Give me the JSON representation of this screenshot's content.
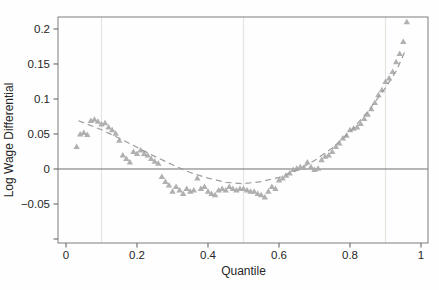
{
  "chart_data": {
    "type": "scatter",
    "title": "",
    "xlabel": "Quantile",
    "ylabel": "Log Wage Differential",
    "xlim": [
      -0.0225,
      1.0197
    ],
    "ylim": [
      -0.1057,
      0.2171
    ],
    "x_ticks": [
      0,
      0.2,
      0.4,
      0.6,
      0.8,
      1
    ],
    "x_tick_labels": [
      "0",
      "0.2",
      "0.4",
      "0.6",
      "0.8",
      "1"
    ],
    "y_ticks": [
      -0.1,
      -0.05,
      0,
      0.05,
      0.1,
      0.15,
      0.2
    ],
    "y_tick_labels": [
      "",
      "−0.05",
      "0",
      "0.05",
      "0.1",
      "0.15",
      "0.2"
    ],
    "gridlines_x": [
      0.1,
      0.5,
      0.9
    ],
    "grid": "vertical-only",
    "zero_line_y": 0,
    "legend": "none",
    "marker": "filled-triangle-up",
    "colors": {
      "marker": "#a9a9a9",
      "fit_line": "#9c9c9c",
      "grid": "#e4e4e0",
      "frame": "#7d7d7d",
      "zero_line": "#6f6f6f",
      "tick": "#5a5a5a",
      "text": "#262626",
      "background": "#fefefe"
    },
    "series_name": "log wage differential by quantile",
    "points": [
      [
        0.03,
        0.032
      ],
      [
        0.04,
        0.05
      ],
      [
        0.05,
        0.052
      ],
      [
        0.06,
        0.049
      ],
      [
        0.07,
        0.069
      ],
      [
        0.08,
        0.071
      ],
      [
        0.09,
        0.068
      ],
      [
        0.1,
        0.064
      ],
      [
        0.11,
        0.066
      ],
      [
        0.12,
        0.06
      ],
      [
        0.13,
        0.056
      ],
      [
        0.14,
        0.051
      ],
      [
        0.15,
        0.041
      ],
      [
        0.16,
        0.02
      ],
      [
        0.17,
        0.015
      ],
      [
        0.18,
        0.01
      ],
      [
        0.19,
        0.025
      ],
      [
        0.2,
        0.022
      ],
      [
        0.21,
        0.027
      ],
      [
        0.22,
        0.022
      ],
      [
        0.23,
        0.02
      ],
      [
        0.24,
        0.015
      ],
      [
        0.25,
        0.011
      ],
      [
        0.26,
        0.008
      ],
      [
        0.27,
        -0.011
      ],
      [
        0.28,
        -0.018
      ],
      [
        0.29,
        -0.023
      ],
      [
        0.3,
        -0.032
      ],
      [
        0.31,
        -0.025
      ],
      [
        0.32,
        -0.03
      ],
      [
        0.33,
        -0.035
      ],
      [
        0.34,
        -0.028
      ],
      [
        0.35,
        -0.032
      ],
      [
        0.36,
        -0.03
      ],
      [
        0.37,
        -0.013
      ],
      [
        0.38,
        -0.028
      ],
      [
        0.39,
        -0.025
      ],
      [
        0.4,
        -0.032
      ],
      [
        0.41,
        -0.035
      ],
      [
        0.42,
        -0.037
      ],
      [
        0.43,
        -0.03
      ],
      [
        0.44,
        -0.028
      ],
      [
        0.45,
        -0.03
      ],
      [
        0.46,
        -0.025
      ],
      [
        0.47,
        -0.028
      ],
      [
        0.48,
        -0.03
      ],
      [
        0.49,
        -0.028
      ],
      [
        0.5,
        -0.028
      ],
      [
        0.51,
        -0.03
      ],
      [
        0.52,
        -0.032
      ],
      [
        0.53,
        -0.032
      ],
      [
        0.54,
        -0.035
      ],
      [
        0.55,
        -0.037
      ],
      [
        0.56,
        -0.04
      ],
      [
        0.57,
        -0.032
      ],
      [
        0.58,
        -0.025
      ],
      [
        0.59,
        -0.028
      ],
      [
        0.6,
        -0.016
      ],
      [
        0.61,
        -0.013
      ],
      [
        0.62,
        -0.009
      ],
      [
        0.63,
        -0.006
      ],
      [
        0.64,
        -0.001
      ],
      [
        0.65,
        0.001
      ],
      [
        0.66,
        0.003
      ],
      [
        0.67,
        0.002
      ],
      [
        0.68,
        0.01
      ],
      [
        0.69,
        0.003
      ],
      [
        0.7,
        -0.001
      ],
      [
        0.71,
        0.001
      ],
      [
        0.72,
        0.013
      ],
      [
        0.73,
        0.018
      ],
      [
        0.74,
        0.02
      ],
      [
        0.75,
        0.025
      ],
      [
        0.76,
        0.032
      ],
      [
        0.77,
        0.037
      ],
      [
        0.78,
        0.044
      ],
      [
        0.79,
        0.048
      ],
      [
        0.8,
        0.056
      ],
      [
        0.81,
        0.058
      ],
      [
        0.82,
        0.06
      ],
      [
        0.83,
        0.065
      ],
      [
        0.84,
        0.072
      ],
      [
        0.85,
        0.078
      ],
      [
        0.86,
        0.086
      ],
      [
        0.87,
        0.095
      ],
      [
        0.88,
        0.106
      ],
      [
        0.89,
        0.113
      ],
      [
        0.9,
        0.125
      ],
      [
        0.91,
        0.13
      ],
      [
        0.92,
        0.139
      ],
      [
        0.93,
        0.153
      ],
      [
        0.94,
        0.165
      ],
      [
        0.95,
        0.182
      ],
      [
        0.96,
        0.21
      ]
    ],
    "fit_curve": {
      "style": "dashed",
      "shape": "quadratic-like U curve",
      "points": [
        [
          0.035,
          0.069
        ],
        [
          0.06,
          0.064
        ],
        [
          0.1,
          0.056
        ],
        [
          0.15,
          0.044
        ],
        [
          0.2,
          0.031
        ],
        [
          0.25,
          0.018
        ],
        [
          0.3,
          0.006
        ],
        [
          0.35,
          -0.005
        ],
        [
          0.4,
          -0.013
        ],
        [
          0.45,
          -0.019
        ],
        [
          0.5,
          -0.021
        ],
        [
          0.55,
          -0.018
        ],
        [
          0.6,
          -0.012
        ],
        [
          0.65,
          -0.002
        ],
        [
          0.7,
          0.012
        ],
        [
          0.75,
          0.03
        ],
        [
          0.8,
          0.053
        ],
        [
          0.85,
          0.082
        ],
        [
          0.9,
          0.116
        ],
        [
          0.93,
          0.14
        ],
        [
          0.955,
          0.168
        ]
      ]
    }
  }
}
